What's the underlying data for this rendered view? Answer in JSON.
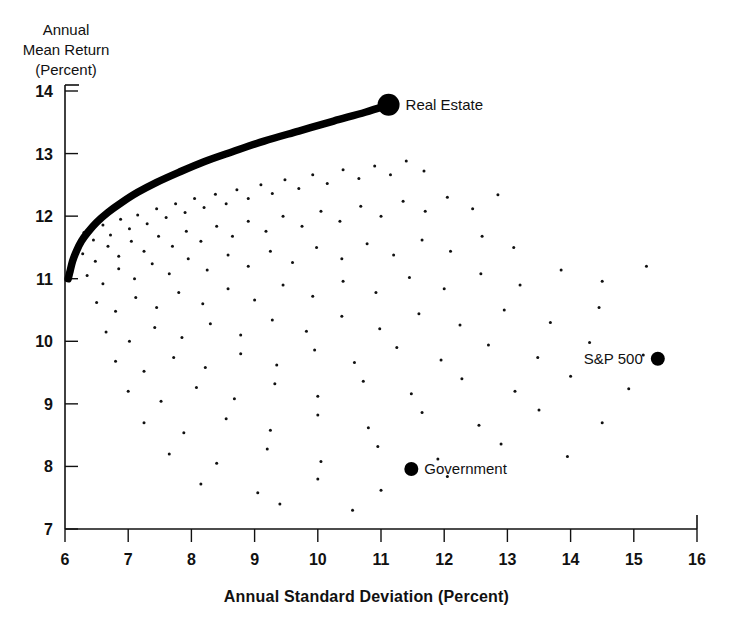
{
  "chart_data": {
    "type": "scatter",
    "title": "",
    "xlabel": "Annual Standard Deviation (Percent)",
    "ylabel": "Annual\nMean Return\n(Percent)",
    "ylabel_lines": [
      "Annual",
      "Mean Return",
      "(Percent)"
    ],
    "xlim": [
      6,
      16
    ],
    "ylim": [
      7,
      14
    ],
    "xticks": [
      6,
      7,
      8,
      9,
      10,
      11,
      12,
      13,
      14,
      15,
      16
    ],
    "yticks": [
      7,
      8,
      9,
      10,
      11,
      12,
      13,
      14
    ],
    "grid": false,
    "legend": "none",
    "series": [
      {
        "name": "Efficient Frontier",
        "type": "line",
        "style": "thick-black-curve",
        "points": [
          [
            6.05,
            11.0
          ],
          [
            6.08,
            11.12
          ],
          [
            6.12,
            11.28
          ],
          [
            6.18,
            11.44
          ],
          [
            6.26,
            11.6
          ],
          [
            6.36,
            11.74
          ],
          [
            6.5,
            11.9
          ],
          [
            6.68,
            12.06
          ],
          [
            6.9,
            12.22
          ],
          [
            7.15,
            12.38
          ],
          [
            7.45,
            12.54
          ],
          [
            7.8,
            12.7
          ],
          [
            8.2,
            12.87
          ],
          [
            8.65,
            13.03
          ],
          [
            9.15,
            13.2
          ],
          [
            9.7,
            13.36
          ],
          [
            10.25,
            13.52
          ],
          [
            10.75,
            13.66
          ],
          [
            11.12,
            13.78
          ]
        ]
      },
      {
        "name": "Portfolio Cloud",
        "type": "scatter",
        "marker": "tiny-dot",
        "points": [
          [
            6.3,
            11.74
          ],
          [
            6.45,
            11.62
          ],
          [
            6.6,
            11.86
          ],
          [
            6.72,
            11.7
          ],
          [
            6.88,
            11.95
          ],
          [
            7.02,
            11.8
          ],
          [
            7.15,
            12.02
          ],
          [
            7.3,
            11.88
          ],
          [
            7.45,
            12.12
          ],
          [
            7.6,
            11.98
          ],
          [
            7.75,
            12.2
          ],
          [
            7.9,
            12.06
          ],
          [
            8.05,
            12.28
          ],
          [
            8.2,
            12.14
          ],
          [
            8.38,
            12.35
          ],
          [
            8.55,
            12.2
          ],
          [
            8.72,
            12.42
          ],
          [
            8.9,
            12.28
          ],
          [
            9.1,
            12.5
          ],
          [
            9.28,
            12.36
          ],
          [
            9.48,
            12.58
          ],
          [
            9.7,
            12.44
          ],
          [
            9.92,
            12.66
          ],
          [
            10.15,
            12.52
          ],
          [
            10.4,
            12.74
          ],
          [
            10.65,
            12.6
          ],
          [
            10.9,
            12.8
          ],
          [
            11.15,
            12.66
          ],
          [
            11.4,
            12.88
          ],
          [
            11.68,
            12.72
          ],
          [
            6.28,
            11.4
          ],
          [
            6.48,
            11.28
          ],
          [
            6.68,
            11.52
          ],
          [
            6.85,
            11.36
          ],
          [
            7.05,
            11.6
          ],
          [
            7.25,
            11.44
          ],
          [
            7.48,
            11.68
          ],
          [
            7.7,
            11.52
          ],
          [
            7.92,
            11.76
          ],
          [
            8.15,
            11.6
          ],
          [
            8.4,
            11.84
          ],
          [
            8.65,
            11.68
          ],
          [
            8.9,
            11.92
          ],
          [
            9.18,
            11.76
          ],
          [
            9.45,
            12.0
          ],
          [
            9.75,
            11.84
          ],
          [
            10.05,
            12.08
          ],
          [
            10.35,
            11.92
          ],
          [
            10.68,
            12.16
          ],
          [
            11.0,
            12.0
          ],
          [
            11.35,
            12.24
          ],
          [
            11.7,
            12.08
          ],
          [
            12.05,
            12.3
          ],
          [
            12.45,
            12.12
          ],
          [
            12.85,
            12.34
          ],
          [
            6.35,
            11.05
          ],
          [
            6.6,
            10.92
          ],
          [
            6.85,
            11.16
          ],
          [
            7.1,
            11.0
          ],
          [
            7.38,
            11.24
          ],
          [
            7.65,
            11.08
          ],
          [
            7.95,
            11.32
          ],
          [
            8.25,
            11.14
          ],
          [
            8.58,
            11.38
          ],
          [
            8.9,
            11.2
          ],
          [
            9.25,
            11.44
          ],
          [
            9.6,
            11.26
          ],
          [
            9.98,
            11.5
          ],
          [
            10.38,
            11.32
          ],
          [
            10.78,
            11.56
          ],
          [
            11.2,
            11.38
          ],
          [
            11.65,
            11.62
          ],
          [
            12.1,
            11.44
          ],
          [
            12.6,
            11.68
          ],
          [
            13.1,
            11.5
          ],
          [
            6.5,
            10.62
          ],
          [
            6.8,
            10.48
          ],
          [
            7.12,
            10.7
          ],
          [
            7.45,
            10.54
          ],
          [
            7.8,
            10.78
          ],
          [
            8.18,
            10.6
          ],
          [
            8.58,
            10.84
          ],
          [
            9.0,
            10.66
          ],
          [
            9.45,
            10.9
          ],
          [
            9.92,
            10.72
          ],
          [
            10.4,
            10.96
          ],
          [
            10.92,
            10.78
          ],
          [
            11.45,
            11.02
          ],
          [
            12.0,
            10.84
          ],
          [
            12.58,
            11.08
          ],
          [
            13.2,
            10.9
          ],
          [
            13.85,
            11.14
          ],
          [
            14.5,
            10.96
          ],
          [
            15.2,
            11.2
          ],
          [
            6.65,
            10.15
          ],
          [
            7.02,
            10.0
          ],
          [
            7.42,
            10.22
          ],
          [
            7.85,
            10.06
          ],
          [
            8.3,
            10.28
          ],
          [
            8.78,
            10.1
          ],
          [
            9.28,
            10.34
          ],
          [
            9.82,
            10.16
          ],
          [
            10.38,
            10.4
          ],
          [
            10.98,
            10.2
          ],
          [
            11.6,
            10.44
          ],
          [
            12.25,
            10.26
          ],
          [
            12.95,
            10.5
          ],
          [
            13.68,
            10.3
          ],
          [
            14.45,
            10.54
          ],
          [
            6.8,
            9.68
          ],
          [
            7.25,
            9.52
          ],
          [
            7.72,
            9.74
          ],
          [
            8.22,
            9.58
          ],
          [
            8.78,
            9.8
          ],
          [
            9.35,
            9.62
          ],
          [
            9.95,
            9.86
          ],
          [
            10.58,
            9.66
          ],
          [
            11.25,
            9.9
          ],
          [
            11.95,
            9.7
          ],
          [
            12.7,
            9.94
          ],
          [
            13.48,
            9.74
          ],
          [
            14.3,
            9.98
          ],
          [
            15.15,
            9.78
          ],
          [
            7.0,
            9.2
          ],
          [
            7.52,
            9.04
          ],
          [
            8.08,
            9.26
          ],
          [
            8.68,
            9.08
          ],
          [
            9.32,
            9.32
          ],
          [
            10.0,
            9.12
          ],
          [
            10.72,
            9.36
          ],
          [
            11.48,
            9.16
          ],
          [
            12.28,
            9.4
          ],
          [
            13.12,
            9.2
          ],
          [
            14.0,
            9.44
          ],
          [
            14.92,
            9.24
          ],
          [
            7.25,
            8.7
          ],
          [
            7.88,
            8.54
          ],
          [
            8.55,
            8.76
          ],
          [
            9.25,
            8.58
          ],
          [
            10.0,
            8.82
          ],
          [
            10.8,
            8.62
          ],
          [
            11.65,
            8.86
          ],
          [
            12.55,
            8.66
          ],
          [
            13.5,
            8.9
          ],
          [
            14.5,
            8.7
          ],
          [
            7.65,
            8.2
          ],
          [
            8.4,
            8.05
          ],
          [
            9.2,
            8.28
          ],
          [
            10.05,
            8.08
          ],
          [
            10.95,
            8.32
          ],
          [
            11.9,
            8.12
          ],
          [
            12.9,
            8.36
          ],
          [
            13.95,
            8.16
          ],
          [
            8.15,
            7.72
          ],
          [
            9.05,
            7.58
          ],
          [
            10.0,
            7.8
          ],
          [
            11.0,
            7.62
          ],
          [
            12.05,
            7.84
          ],
          [
            9.4,
            7.4
          ],
          [
            10.55,
            7.3
          ]
        ]
      }
    ],
    "annotated_points": [
      {
        "label": "Real Estate",
        "x": 11.12,
        "y": 13.78,
        "label_side": "right"
      },
      {
        "label": "S&P 500",
        "x": 15.38,
        "y": 9.72,
        "label_side": "left"
      },
      {
        "label": "Government",
        "x": 11.48,
        "y": 7.96,
        "label_side": "right"
      }
    ]
  },
  "colors": {
    "ink": "#111111",
    "background": "#ffffff",
    "curve": "#000000"
  }
}
